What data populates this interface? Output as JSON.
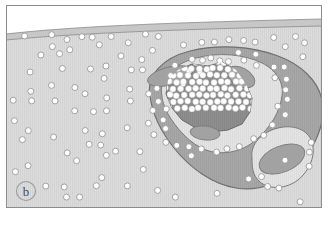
{
  "figure": {
    "domain": "diagram",
    "kind": "histology-schematic",
    "panel_label": "b",
    "width": 328,
    "height": 213,
    "caption_visible": false
  },
  "frame": {
    "border_color": "#8c8c8c",
    "border_width": 1,
    "background": "#ffffff"
  },
  "colors": {
    "white_space": "#ffffff",
    "tissue_light": "#dcdcdc",
    "tissue_stripe": "#d2d2d2",
    "surface_band": "#c9c9c9",
    "capsule_dark": "#a6a6a6",
    "inner_pale": "#e4e4e4",
    "core_dark": "#8d8d8d",
    "blob_gray": "#a0a0a0",
    "dot_fill": "#ffffff",
    "dot_stroke": "#9a9a9a",
    "outline": "#707070",
    "label_text": "#4a4a4a"
  },
  "regions": [
    {
      "name": "upper-white-space",
      "label": "Luminal / unstained space above tissue surface",
      "fill": "#ffffff"
    },
    {
      "name": "surface-band",
      "label": "Thin surface lining band",
      "fill": "#c9c9c9"
    },
    {
      "name": "stromal-tissue",
      "label": "Striated stromal tissue field with scattered round cells",
      "fill": "#dcdcdc"
    },
    {
      "name": "lesion-capsule",
      "label": "Outer dark capsule of lesion",
      "fill": "#a6a6a6"
    },
    {
      "name": "lesion-inner-zone",
      "label": "Pale inner zone inside capsule",
      "fill": "#e4e4e4"
    },
    {
      "name": "lesion-core",
      "label": "Dark central core studded with round cells",
      "fill": "#8d8d8d"
    },
    {
      "name": "lobe-bottom-right",
      "label": "Bottom-right pale lobe with gray inclusion",
      "fill": "#e4e4e4"
    }
  ],
  "inclusions": [
    {
      "name": "inclusion-upper-left",
      "cx": 170,
      "cy": 76,
      "rx": 23,
      "ry": 9,
      "rot": -14,
      "fill": "#a0a0a0"
    },
    {
      "name": "inclusion-upper-right",
      "cx": 240,
      "cy": 78,
      "rx": 15,
      "ry": 9,
      "rot": 28,
      "fill": "#a0a0a0"
    },
    {
      "name": "inclusion-lower-middle",
      "cx": 204,
      "cy": 132,
      "rx": 15,
      "ry": 7,
      "rot": 8,
      "fill": "#a0a0a0"
    },
    {
      "name": "inclusion-bottom-right",
      "cx": 281,
      "cy": 160,
      "rx": 24,
      "ry": 13,
      "rot": -22,
      "fill": "#a0a0a0"
    }
  ],
  "cell_dots": {
    "description": "Small round white cells with gray outline, scattered in stroma, concentrated around the lesion capsule and packed inside the dark core",
    "radius_stroma": 3.0,
    "radius_core": 3.0,
    "fill": "#ffffff",
    "stroke": "#9a9a9a",
    "stroke_width": 0.9,
    "stroma_count": 96,
    "rim_count": 58,
    "core_count": 74
  }
}
